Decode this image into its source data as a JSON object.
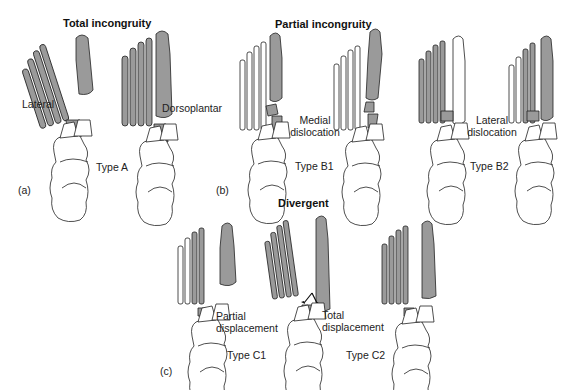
{
  "figure": {
    "panels": [
      {
        "id": "a",
        "panel_label": "(a)",
        "title": "Total incongruity",
        "feet": [
          {
            "label": "Lateral",
            "shaded": "all metatarsals + cuneiform"
          },
          {
            "label": "Dorsoplantar",
            "shaded": "all metatarsals + cuneiform"
          }
        ],
        "type_label": "Type A"
      },
      {
        "id": "b",
        "panel_label": "(b)",
        "title": "Partial incongruity",
        "subtypes": [
          {
            "description_line1": "Medial",
            "description_line2": "dislocation",
            "type_label": "Type B1"
          },
          {
            "description_line1": "Lateral",
            "description_line2": "dislocation",
            "type_label": "Type B2"
          }
        ]
      },
      {
        "id": "c",
        "panel_label": "(c)",
        "title": "Divergent",
        "subtypes": [
          {
            "description_line1": "Partial",
            "description_line2": "displacement",
            "type_label": "Type C1"
          },
          {
            "description_line1": "Total",
            "description_line2": "displacement",
            "type_label": "Type C2"
          }
        ]
      }
    ],
    "colors": {
      "bone_fill": "#ffffff",
      "displaced_fill": "#9a9a9a",
      "outline": "#222222"
    }
  }
}
